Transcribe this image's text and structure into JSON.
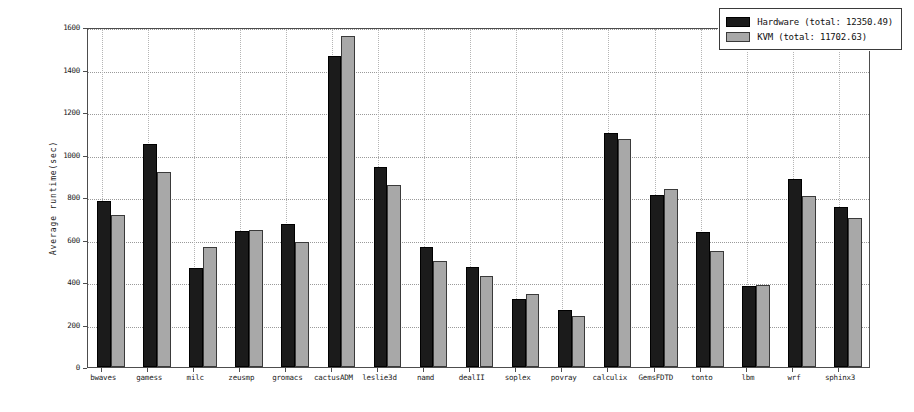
{
  "chart_data": {
    "type": "bar",
    "title": "",
    "subtitle": "",
    "xlabel": "",
    "ylabel": "Average runtime(sec)",
    "ylim": [
      0,
      1600
    ],
    "ytick_values": [
      0,
      200,
      400,
      600,
      800,
      1000,
      1200,
      1400,
      1600
    ],
    "ytick_labels": [
      "0",
      "200",
      "400",
      "600",
      "800",
      "1000",
      "1200",
      "1400",
      "1600"
    ],
    "grid": true,
    "grid_style": "dotted",
    "legend_position": "upper right",
    "categories": [
      "bwaves",
      "gamess",
      "milc",
      "zeusmp",
      "gromacs",
      "cactusADM",
      "leslie3d",
      "namd",
      "dealII",
      "soplex",
      "povray",
      "calculix",
      "GemsFDTD",
      "tonto",
      "lbm",
      "wrf",
      "sphinx3"
    ],
    "series": [
      {
        "name": "Hardware (total: 12350.49)",
        "short_name": "Hardware",
        "total": "12350.49",
        "color": "#1b1b1b",
        "values": [
          780,
          1050,
          465,
          640,
          672,
          1465,
          940,
          565,
          470,
          320,
          270,
          1100,
          810,
          635,
          380,
          885,
          755
        ]
      },
      {
        "name": "KVM (total: 11702.63)",
        "short_name": "KVM",
        "total": "11702.63",
        "color": "#a8a8a8",
        "values": [
          715,
          920,
          565,
          645,
          588,
          1560,
          855,
          500,
          430,
          345,
          240,
          1075,
          840,
          545,
          385,
          805,
          700
        ]
      }
    ]
  },
  "legend": {
    "entries": [
      {
        "label": "Hardware (total: 12350.49)"
      },
      {
        "label": "KVM (total: 11702.63)"
      }
    ]
  },
  "axis": {
    "y_label": "Average runtime(sec)"
  }
}
